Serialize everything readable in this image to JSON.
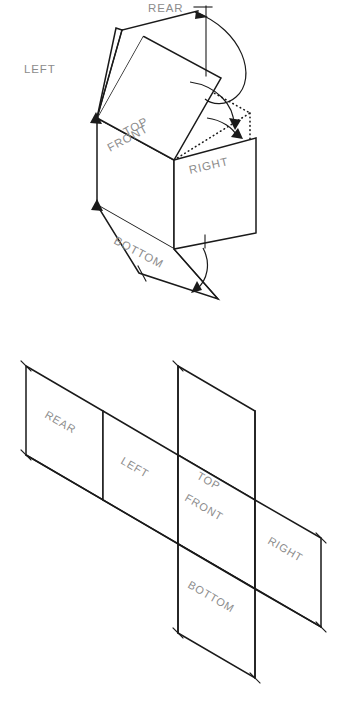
{
  "figure": {
    "width": 349,
    "height": 711,
    "background_color": "#ffffff",
    "line_color": "#1a1a1a",
    "label_color": "#8c8c8c"
  },
  "faces": {
    "top": "TOP",
    "front": "FRONT",
    "right": "RIGHT",
    "left": "LEFT",
    "rear": "REAR",
    "bottom": "BOTTOM"
  },
  "upper_diagram": {
    "name": "glass-box-pictorial",
    "labels": {
      "rear": "REAR",
      "left": "LEFT",
      "top": "TOP",
      "front": "FRONT",
      "right": "RIGHT",
      "bottom": "BOTTOM"
    }
  },
  "lower_diagram": {
    "name": "unfolded-view-layout",
    "labels": {
      "rear": "REAR",
      "left": "LEFT",
      "top": "TOP",
      "front": "FRONT",
      "right": "RIGHT",
      "bottom": "BOTTOM"
    }
  },
  "caption": {
    "text": ""
  }
}
